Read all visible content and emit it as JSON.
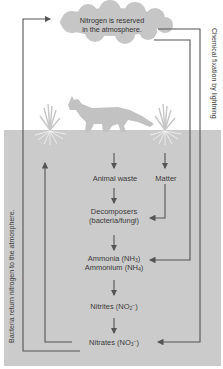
{
  "diagram": {
    "atmosphere": {
      "line1": "Nitrogen is reserved",
      "line2": "in the atmosphere."
    },
    "side_labels": {
      "right": "Chemical fixation by lightning",
      "left": "Bacteria return nitrogen to the atmosphere."
    },
    "nodes": {
      "animal_waste": "Animal waste",
      "matter": "Matter",
      "decomposers_1": "Decomposers",
      "decomposers_2": "(bacteria/fungi)",
      "ammonia": "Ammonia (NH",
      "ammonia_sub": "3",
      "ammonia_close": ")",
      "ammonium": "Ammonium (NH",
      "ammonium_sub": "4",
      "ammonium_close": ")",
      "nitrites": "Nitrites (NO",
      "nitrites_sup": "−",
      "nitrites_sub": "2",
      "nitrites_close": ")",
      "nitrates": "Nitrates (NO",
      "nitrates_sup": "−",
      "nitrates_sub": "3",
      "nitrates_close": ")"
    },
    "illustrations": [
      "cloud",
      "fox-silhouette",
      "plant-left",
      "plant-right"
    ],
    "colors": {
      "soil": "#cbcbcb",
      "cloud": "#c6c6c6",
      "silhouette": "#c2c2c2",
      "arrow": "#555555"
    }
  }
}
